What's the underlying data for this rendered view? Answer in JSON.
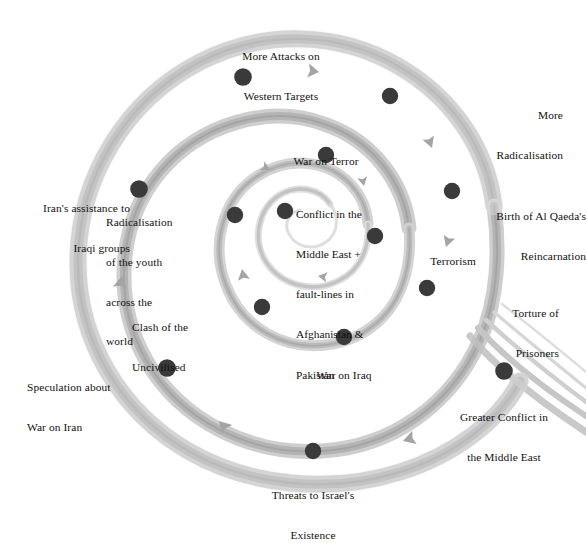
{
  "diagram": {
    "type": "spiral-cycle-diagram",
    "title": "",
    "background_color": "#ffffff",
    "band_color": "#b3b3b3",
    "band_highlight_color": "#d9d9d9",
    "band_shadow_color": "#9a9a9a",
    "node_color": "#3a3a3a",
    "text_color": "#111111",
    "arrow_color": "#a0a0a0",
    "direction": "counter-clockwise-inward",
    "center": {
      "label": "Conflict in the\nMiddle East +\nfault-lines in\nAfghanistan &\nPakistan",
      "lines": [
        "Conflict in the",
        "Middle East +",
        "fault-lines in",
        "Afghanistan &",
        "Pakistan"
      ]
    },
    "nodes": [
      {
        "id": "conflict-middle-east",
        "label": "Conflict in the Middle East + fault-lines in Afghanistan & Pakistan",
        "lines": [
          "Conflict in the",
          "Middle East +",
          "fault-lines in",
          "Afghanistan &",
          "Pakistan"
        ],
        "x": 285,
        "y": 211,
        "label_x": 296,
        "label_y": 181,
        "align": "left"
      },
      {
        "id": "terrorism",
        "label": "Terrorism",
        "lines": [
          "Terrorism"
        ],
        "x": 375,
        "y": 236,
        "label_x": 387,
        "label_y": 229,
        "align": "left"
      },
      {
        "id": "war-on-terror",
        "label": "War on Terror",
        "lines": [
          "War on Terror"
        ],
        "x": 326,
        "y": 155,
        "label_x": 326,
        "label_y": 130,
        "align": "center"
      },
      {
        "id": "war-on-iraq",
        "label": "War on Iraq",
        "lines": [
          "War on Iraq"
        ],
        "x": 344,
        "y": 337,
        "label_x": 344,
        "label_y": 343,
        "align": "center"
      },
      {
        "id": "clash-of-the-uncivilised",
        "label": "Clash of the Uncivilised",
        "lines": [
          "Clash of the",
          "Uncivilised"
        ],
        "x": 262,
        "y": 307,
        "label_x": 252,
        "label_y": 295,
        "align": "right"
      },
      {
        "id": "radicalisation-of-the-youth",
        "label": "Radicalisation of the youth across the world",
        "lines": [
          "Radicalisation",
          "of the youth",
          "across the",
          "world"
        ],
        "x": 235,
        "y": 215,
        "label_x": 226,
        "label_y": 190,
        "align": "right"
      },
      {
        "id": "torture-of-prisoners",
        "label": "Torture of Prisoners",
        "lines": [
          "Torture of",
          "Prisoners"
        ],
        "x": 427,
        "y": 288,
        "label_x": 440,
        "label_y": 281,
        "align": "left"
      },
      {
        "id": "birth-of-al-qaedas-reincarnation",
        "label": "Birth of Al Qaeda's Reincarnation",
        "lines": [
          "Birth of Al Qaeda's",
          "Reincarnation"
        ],
        "x": 452,
        "y": 191,
        "label_x": 465,
        "label_y": 184,
        "align": "left"
      },
      {
        "id": "more-radicalisation",
        "label": "More Radicalisation",
        "lines": [
          "More",
          "Radicalisation"
        ],
        "x": 390,
        "y": 96,
        "label_x": 404,
        "label_y": 84,
        "align": "left"
      },
      {
        "id": "more-attacks-on-western-targets",
        "label": "More Attacks on Western Targets",
        "lines": [
          "More Attacks on",
          "Western Targets"
        ],
        "x": 243,
        "y": 77,
        "label_x": 280,
        "label_y": 26,
        "align": "center"
      },
      {
        "id": "irans-assistance-to-iraqi-groups",
        "label": "Iran's assistance to Iraqi groups",
        "lines": [
          "Iran's assistance to",
          "Iraqi groups"
        ],
        "x": 139,
        "y": 189,
        "label_x": 130,
        "label_y": 177,
        "align": "right"
      },
      {
        "id": "speculation-about-war-on-iran",
        "label": "Speculation about War on Iran",
        "lines": [
          "Speculation about",
          "War on Iran"
        ],
        "x": 167,
        "y": 368,
        "label_x": 157,
        "label_y": 355,
        "align": "right"
      },
      {
        "id": "threats-to-israels-existence",
        "label": "Threats to Israel's Existence",
        "lines": [
          "Threats to Israel's",
          "Existence"
        ],
        "x": 313,
        "y": 451,
        "label_x": 313,
        "label_y": 463,
        "align": "center"
      },
      {
        "id": "greater-conflict-in-the-middle-east",
        "label": "Greater Conflict in the Middle East",
        "lines": [
          "Greater Conflict in",
          "the Middle East"
        ],
        "x": 504,
        "y": 371,
        "label_x": 504,
        "label_y": 385,
        "align": "center"
      }
    ],
    "arrows": [
      {
        "id": "arrow-outer-top",
        "x": 319,
        "y": 72,
        "rotation": 190
      },
      {
        "id": "arrow-outer-left",
        "x": 126,
        "y": 273,
        "rotation": 105
      },
      {
        "id": "arrow-outer-bottom-left",
        "x": 218,
        "y": 420,
        "rotation": 45
      },
      {
        "id": "arrow-outer-bottom-right",
        "x": 403,
        "y": 440,
        "rotation": -15
      },
      {
        "id": "arrow-mid-right-upper",
        "x": 433,
        "y": 147,
        "rotation": 247
      },
      {
        "id": "arrow-mid-right-lower",
        "x": 447,
        "y": 245,
        "rotation": 285
      },
      {
        "id": "arrow-mid-left",
        "x": 243,
        "y": 268,
        "rotation": 78
      },
      {
        "id": "arrow-inner-top-left",
        "x": 269,
        "y": 169,
        "rotation": 210
      },
      {
        "id": "arrow-inner-right",
        "x": 366,
        "y": 185,
        "rotation": 255
      },
      {
        "id": "arrow-inner-bottom",
        "x": 319,
        "y": 275,
        "rotation": 10
      }
    ]
  }
}
